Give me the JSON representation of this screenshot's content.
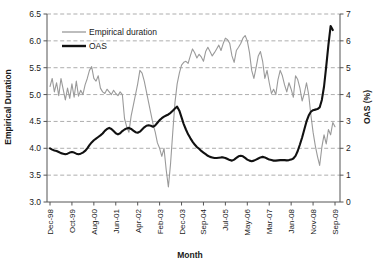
{
  "chart_data": {
    "type": "line",
    "title": "",
    "xlabel": "Month",
    "ylabel": "Empirical Duration",
    "y2label": "OAS (%)",
    "grid": true,
    "legend_position": "top-left-inside",
    "ylim": [
      3.0,
      6.5
    ],
    "y2lim": [
      0,
      7
    ],
    "yticks": [
      "3.0",
      "3.5",
      "4.0",
      "4.5",
      "5.0",
      "5.5",
      "6.0",
      "6.5"
    ],
    "y2ticks": [
      "0",
      "1",
      "2",
      "3",
      "4",
      "5",
      "6",
      "7"
    ],
    "xticks": [
      "Dec-98",
      "Oct-99",
      "Aug-00",
      "Jun-01",
      "Apr-02",
      "Feb-03",
      "Dec-03",
      "Sep-04",
      "Jul-05",
      "May-06",
      "Mar-07",
      "Jan-08",
      "Nov-08",
      "Sep-09"
    ],
    "x_start_month": "Dec-98",
    "x_end_month": "Sep-09",
    "n_points": 131,
    "colors": {
      "empirical_duration": "#9a9a9a",
      "oas": "#111111",
      "grid": "#8a8a8a",
      "axis": "#555555"
    },
    "series": [
      {
        "name": "Empirical duration",
        "axis": "left",
        "color": "#9a9a9a",
        "width": 1.1,
        "units": "years",
        "values": [
          5.15,
          5.3,
          5.05,
          5.22,
          4.98,
          5.3,
          5.1,
          4.9,
          5.12,
          4.93,
          5.2,
          4.95,
          5.25,
          4.97,
          5.08,
          5.0,
          5.18,
          5.3,
          5.45,
          5.52,
          5.3,
          5.25,
          5.35,
          5.12,
          5.05,
          5.02,
          5.1,
          5.05,
          5.0,
          5.08,
          5.02,
          4.98,
          5.05,
          5.0,
          4.55,
          4.4,
          4.3,
          4.6,
          4.8,
          5.0,
          5.2,
          5.45,
          5.4,
          5.25,
          5.05,
          4.85,
          4.65,
          4.45,
          4.3,
          4.1,
          4.0,
          3.85,
          4.0,
          3.6,
          3.28,
          3.72,
          4.3,
          4.85,
          5.2,
          5.4,
          5.55,
          5.6,
          5.62,
          5.58,
          5.72,
          5.85,
          5.78,
          5.68,
          5.75,
          5.7,
          5.62,
          5.8,
          5.88,
          5.8,
          5.72,
          5.78,
          5.85,
          5.92,
          5.82,
          5.95,
          6.05,
          6.02,
          5.95,
          5.72,
          5.6,
          5.82,
          5.88,
          5.95,
          6.05,
          6.1,
          6.0,
          5.78,
          5.45,
          5.3,
          5.5,
          5.72,
          5.8,
          5.62,
          5.3,
          5.45,
          5.22,
          5.02,
          5.1,
          5.0,
          5.28,
          5.45,
          5.35,
          5.18,
          5.05,
          5.22,
          5.1,
          4.95,
          5.35,
          5.28,
          5.12,
          4.88,
          5.02,
          5.22,
          5.0,
          4.62,
          4.3,
          4.05,
          3.85,
          3.68,
          4.02,
          4.25,
          4.08,
          4.35,
          4.25,
          4.48,
          4.4
        ]
      },
      {
        "name": "OAS",
        "axis": "right",
        "color": "#111111",
        "width": 2.1,
        "units": "%",
        "values": [
          2.0,
          1.95,
          1.92,
          1.9,
          1.86,
          1.82,
          1.8,
          1.78,
          1.8,
          1.84,
          1.86,
          1.84,
          1.8,
          1.78,
          1.8,
          1.84,
          1.9,
          2.0,
          2.12,
          2.22,
          2.3,
          2.36,
          2.42,
          2.48,
          2.55,
          2.65,
          2.72,
          2.76,
          2.72,
          2.64,
          2.56,
          2.52,
          2.56,
          2.64,
          2.7,
          2.74,
          2.76,
          2.72,
          2.66,
          2.6,
          2.58,
          2.62,
          2.7,
          2.78,
          2.84,
          2.86,
          2.84,
          2.8,
          2.85,
          2.95,
          3.05,
          3.12,
          3.18,
          3.22,
          3.26,
          3.32,
          3.4,
          3.48,
          3.55,
          3.4,
          3.15,
          2.9,
          2.7,
          2.52,
          2.38,
          2.25,
          2.14,
          2.05,
          1.98,
          1.9,
          1.84,
          1.78,
          1.72,
          1.68,
          1.66,
          1.64,
          1.64,
          1.65,
          1.66,
          1.66,
          1.64,
          1.6,
          1.56,
          1.54,
          1.58,
          1.64,
          1.7,
          1.72,
          1.7,
          1.64,
          1.58,
          1.54,
          1.52,
          1.54,
          1.58,
          1.62,
          1.66,
          1.68,
          1.66,
          1.62,
          1.58,
          1.56,
          1.54,
          1.54,
          1.55,
          1.56,
          1.56,
          1.56,
          1.55,
          1.56,
          1.58,
          1.62,
          1.72,
          1.9,
          2.14,
          2.4,
          2.7,
          3.0,
          3.22,
          3.36,
          3.42,
          3.44,
          3.46,
          3.52,
          3.8,
          4.3,
          5.05,
          5.85,
          6.55,
          6.98,
          6.92
        ],
        "truncated_before_end": true,
        "last_drawn_value": 6.4,
        "peak_value": 7.0,
        "peak_label": "late-2008 peak near 7%"
      }
    ]
  },
  "legend": {
    "items": [
      {
        "label": "Empirical duration",
        "style": "thin-gray-line"
      },
      {
        "label": "OAS",
        "style": "thick-black-line"
      }
    ]
  },
  "axes": {
    "left": {
      "title": "Empirical Duration"
    },
    "right": {
      "title": "OAS (%)"
    },
    "bottom": {
      "title": "Month"
    }
  }
}
